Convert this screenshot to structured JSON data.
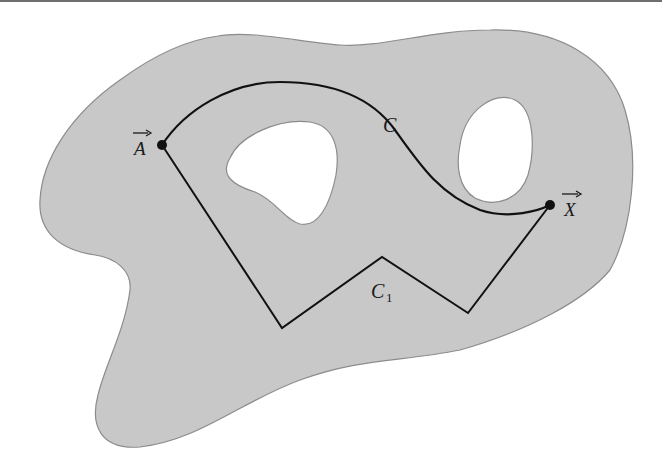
{
  "figure": {
    "region_fill": "#c8c8c8",
    "region_stroke": "#8c8c8c",
    "hole_fill": "#ffffff",
    "path_color": "#111111"
  },
  "points": {
    "A": {
      "label": "A",
      "vector_arrow": "→",
      "x": 162,
      "y": 145
    },
    "X": {
      "label": "X",
      "vector_arrow": "→",
      "x": 550,
      "y": 205
    }
  },
  "curves": {
    "C": {
      "label": "C",
      "type": "smooth"
    },
    "C1": {
      "label": "C",
      "subscript": "1",
      "type": "polygonal"
    }
  }
}
